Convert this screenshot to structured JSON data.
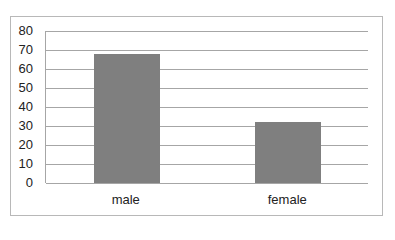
{
  "chart_data": {
    "type": "bar",
    "title": "",
    "xlabel": "",
    "ylabel": "",
    "categories": [
      "male",
      "female"
    ],
    "values": [
      68,
      32
    ],
    "ylim": [
      0,
      80
    ],
    "yticks": [
      "0",
      "10",
      "20",
      "30",
      "40",
      "50",
      "60",
      "70",
      "80"
    ],
    "grid": true,
    "legend": null,
    "bar_color": "#7f7f7f",
    "gridline_color": "#a6a6a6"
  }
}
